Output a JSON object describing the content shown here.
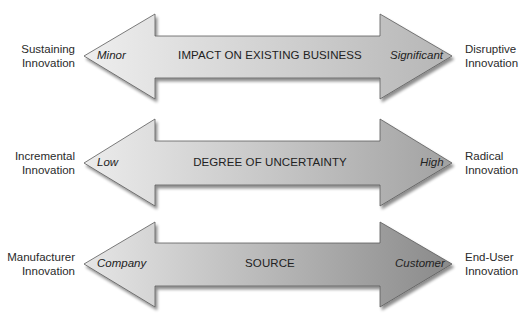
{
  "diagram": {
    "rows": [
      {
        "left_outer_label": [
          "Sustaining",
          "Innovation"
        ],
        "left_end": "Minor",
        "center": "IMPACT ON EXISTING BUSINESS",
        "right_end": "Significant",
        "right_outer_label": [
          "Disruptive",
          "Innovation"
        ],
        "gradient": {
          "left": "#eeeeee",
          "right": "#b8b8b8"
        }
      },
      {
        "left_outer_label": [
          "Incremental",
          "Innovation"
        ],
        "left_end": "Low",
        "center": "DEGREE OF UNCERTAINTY",
        "right_end": "High",
        "right_outer_label": [
          "Radical",
          "Innovation"
        ],
        "gradient": {
          "left": "#ececec",
          "right": "#a4a4a4"
        }
      },
      {
        "left_outer_label": [
          "Manufacturer",
          "Innovation"
        ],
        "left_end": "Company",
        "center": "SOURCE",
        "right_end": "Customer",
        "right_outer_label": [
          "End-User",
          "Innovation"
        ],
        "gradient": {
          "left": "#e8e8e8",
          "right": "#8e8e8e"
        }
      }
    ],
    "colors": {
      "arrow_outline": "#555555",
      "shadow": "#9a9a9a",
      "background": "#ffffff"
    }
  }
}
